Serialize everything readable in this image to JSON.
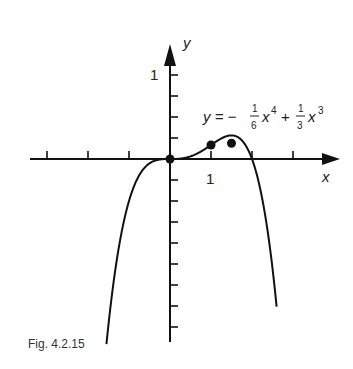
{
  "chart_data": {
    "type": "line",
    "title": "",
    "equation": "y = -1/6 x^4 + 1/3 x^3",
    "xlabel": "x",
    "ylabel": "y",
    "x_tick_label": "1",
    "y_tick_label": "1",
    "x_ticks": [
      -3,
      -2,
      -1,
      1,
      2,
      3
    ],
    "x_tick_step": 0.5,
    "x_tick_values": [
      -1.5,
      -1,
      -0.5,
      0.5,
      1,
      1.5
    ],
    "y_tick_values": [
      1,
      0.75,
      0.5,
      0.25,
      -0.25,
      -0.5,
      -0.75,
      -1,
      -1.25,
      -1.5,
      -1.75,
      -2
    ],
    "xlim": [
      -3.4,
      4.0
    ],
    "ylim": [
      -2.1,
      1.15
    ],
    "grid": false,
    "marked_points": [
      {
        "x": 0,
        "y": 0
      },
      {
        "x": 1,
        "y": 0.1667
      },
      {
        "x": 1.5,
        "y": 0.1875
      }
    ],
    "series": [
      {
        "name": "y = -1/6 x^4 + 1/3 x^3",
        "function": "-x^4/6 + x^3/3",
        "x_range": [
          -1.55,
          2.6
        ]
      }
    ]
  },
  "labels": {
    "y_axis": "y",
    "x_axis": "x",
    "y_one": "1",
    "x_one": "1",
    "eq_lhs": "y = −",
    "eq_frac1_num": "1",
    "eq_frac1_den": "6",
    "eq_x4": "x",
    "eq_exp4": "4",
    "eq_plus": "+",
    "eq_frac2_num": "1",
    "eq_frac2_den": "3",
    "eq_x3": "x",
    "eq_exp3": "3",
    "caption": "Fig. 4.2.15"
  }
}
